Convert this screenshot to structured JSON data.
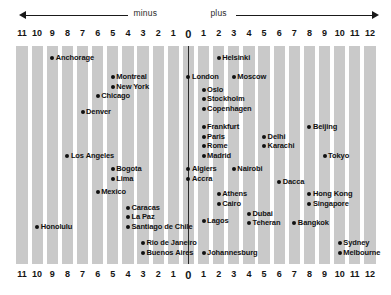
{
  "header": {
    "minus_label": "minus",
    "plus_label": "plus"
  },
  "chart_data": {
    "type": "scatter",
    "title": "",
    "subtitle": "",
    "xlabel": "",
    "ylabel": "",
    "legend_position": "none",
    "grid": true,
    "direction_labels": {
      "negative": "minus",
      "positive": "plus"
    },
    "x_axis": {
      "ticks": [
        "11",
        "10",
        "9",
        "8",
        "7",
        "6",
        "5",
        "4",
        "3",
        "2",
        "1",
        "0",
        "1",
        "2",
        "3",
        "4",
        "5",
        "6",
        "7",
        "8",
        "9",
        "10",
        "11",
        "12"
      ],
      "tick_offsets": [
        -11,
        -10,
        -9,
        -8,
        -7,
        -6,
        -5,
        -4,
        -3,
        -2,
        -1,
        0,
        1,
        2,
        3,
        4,
        5,
        6,
        7,
        8,
        9,
        10,
        11,
        12
      ],
      "range": [
        -11,
        12
      ],
      "zero_marker": "0"
    },
    "points": [
      {
        "name": "Anchorage",
        "offset": -9,
        "row": 0
      },
      {
        "name": "Montreal",
        "offset": -5,
        "row": 2
      },
      {
        "name": "New York",
        "offset": -5,
        "row": 3
      },
      {
        "name": "Chicago",
        "offset": -6,
        "row": 4
      },
      {
        "name": "Denver",
        "offset": -7,
        "row": 5.6
      },
      {
        "name": "Los Angeles",
        "offset": -8,
        "row": 10.2
      },
      {
        "name": "Bogota",
        "offset": -5,
        "row": 11.6
      },
      {
        "name": "Lima",
        "offset": -5,
        "row": 12.6
      },
      {
        "name": "Mexico",
        "offset": -6,
        "row": 14.0
      },
      {
        "name": "Caracas",
        "offset": -4,
        "row": 15.6
      },
      {
        "name": "La Paz",
        "offset": -4,
        "row": 16.6
      },
      {
        "name": "Santiago de Chile",
        "offset": -4,
        "row": 17.6
      },
      {
        "name": "Honolulu",
        "offset": -10,
        "row": 17.6
      },
      {
        "name": "Rio de Janeiro",
        "offset": -3,
        "row": 19.3
      },
      {
        "name": "Buenos Aires",
        "offset": -3,
        "row": 20.3
      },
      {
        "name": "Helsinki",
        "offset": 2,
        "row": 0
      },
      {
        "name": "London",
        "offset": 0,
        "row": 2
      },
      {
        "name": "Moscow",
        "offset": 3,
        "row": 2
      },
      {
        "name": "Oslo",
        "offset": 1,
        "row": 3.3
      },
      {
        "name": "Stockholm",
        "offset": 1,
        "row": 4.3
      },
      {
        "name": "Copenhagen",
        "offset": 1,
        "row": 5.3
      },
      {
        "name": "Frankfurt",
        "offset": 1,
        "row": 7.2
      },
      {
        "name": "Paris",
        "offset": 1,
        "row": 8.2
      },
      {
        "name": "Rome",
        "offset": 1,
        "row": 9.2
      },
      {
        "name": "Madrid",
        "offset": 1,
        "row": 10.2
      },
      {
        "name": "Beijing",
        "offset": 8,
        "row": 7.2
      },
      {
        "name": "Delhi",
        "offset": 5,
        "row": 8.2
      },
      {
        "name": "Karachi",
        "offset": 5,
        "row": 9.2
      },
      {
        "name": "Tokyo",
        "offset": 9,
        "row": 10.2
      },
      {
        "name": "Algiers",
        "offset": 0,
        "row": 11.6
      },
      {
        "name": "Accra",
        "offset": 0,
        "row": 12.6
      },
      {
        "name": "Nairobi",
        "offset": 3,
        "row": 11.6
      },
      {
        "name": "Dacca",
        "offset": 6,
        "row": 12.9
      },
      {
        "name": "Athens",
        "offset": 2,
        "row": 14.2
      },
      {
        "name": "Cairo",
        "offset": 2,
        "row": 15.2
      },
      {
        "name": "Hong Kong",
        "offset": 8,
        "row": 14.2
      },
      {
        "name": "Singapore",
        "offset": 8,
        "row": 15.2
      },
      {
        "name": "Dubai",
        "offset": 4,
        "row": 16.2
      },
      {
        "name": "Teheran",
        "offset": 4,
        "row": 17.2
      },
      {
        "name": "Lagos",
        "offset": 1,
        "row": 17.0
      },
      {
        "name": "Bangkok",
        "offset": 7,
        "row": 17.2
      },
      {
        "name": "Sydney",
        "offset": 10,
        "row": 19.3
      },
      {
        "name": "Melbourne",
        "offset": 10,
        "row": 20.3
      },
      {
        "name": "Johannesburg",
        "offset": 1,
        "row": 20.3
      }
    ]
  },
  "colors": {
    "stripe": "#c9c9c9",
    "background": "#ffffff",
    "text": "#111111",
    "meridian": "#2a2a2a"
  }
}
